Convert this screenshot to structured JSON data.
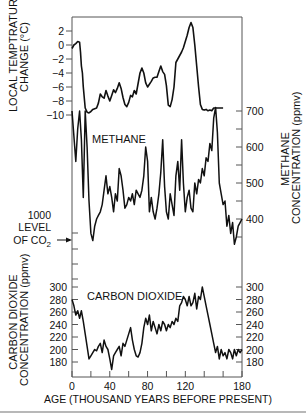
{
  "chart_data": {
    "type": "line",
    "title": "",
    "xlabel": "AGE (THOUSAND YEARS BEFORE PRESENT)",
    "x_ticks": [
      0,
      40,
      80,
      120,
      180
    ],
    "x_minor_ticks": [
      20,
      60,
      100,
      140,
      160
    ],
    "xlim": [
      0,
      180
    ],
    "panels": [
      {
        "name": "temperature",
        "ylabel_lines": [
          "LOCAL TEMPTRATURE",
          "CHANGE (°C)"
        ],
        "axis_side": "left",
        "y_ticks": [
          2,
          0,
          -2,
          -4,
          -6,
          -8,
          -10
        ],
        "ylim": [
          -10,
          3
        ],
        "series": [
          {
            "name": "Local temperature change",
            "x": [
              0,
              2,
              4,
              6,
              8,
              9,
              10,
              11,
              12,
              14,
              16,
              18,
              20,
              22,
              24,
              26,
              28,
              30,
              32,
              34,
              36,
              38,
              40,
              42,
              44,
              46,
              48,
              50,
              52,
              54,
              56,
              58,
              60,
              62,
              64,
              66,
              68,
              70,
              72,
              74,
              76,
              78,
              80,
              82,
              84,
              86,
              88,
              90,
              92,
              94,
              96,
              98,
              100,
              102,
              104,
              106,
              108,
              110,
              112,
              114,
              116,
              118,
              120,
              122,
              124,
              126,
              128,
              130,
              132,
              134,
              136,
              138,
              140,
              142,
              144,
              146,
              148,
              150,
              152,
              154,
              156,
              158,
              160
            ],
            "values": [
              -0.5,
              0,
              0.2,
              0.5,
              0.4,
              -1,
              -3,
              -4,
              -6,
              -9,
              -9.6,
              -9.7,
              -9.5,
              -9.2,
              -9.1,
              -9,
              -8.3,
              -7,
              -7.4,
              -7.6,
              -6.5,
              -7.3,
              -8,
              -7.2,
              -6.4,
              -6.8,
              -6.2,
              -5.4,
              -6.2,
              -7.5,
              -8.5,
              -8.8,
              -8.2,
              -7.2,
              -7.4,
              -6.5,
              -7,
              -5.5,
              -4,
              -3.3,
              -4,
              -5.4,
              -6,
              -5.6,
              -5.2,
              -4.7,
              -4.6,
              -4.6,
              -3.8,
              -3,
              -3.8,
              -4.2,
              -5.8,
              -8.6,
              -8.8,
              -7.8,
              -6,
              -2.5,
              -2,
              -1.5,
              -1,
              -0.4,
              0.5,
              1.4,
              2.5,
              3.2,
              2.5,
              0,
              -3,
              -6,
              -8.5,
              -9.2,
              -9.3,
              -9.2,
              -9.4,
              -9.3,
              -9.4,
              -9,
              -9,
              -9,
              -9,
              -9,
              -9
            ],
            "color": "#111111"
          }
        ]
      },
      {
        "name": "methane",
        "label": "METHANE",
        "ylabel_lines": [
          "METHANE",
          "CONCENTRATION (ppmv)"
        ],
        "axis_side": "right",
        "y_ticks": [
          400,
          500,
          600,
          700
        ],
        "y_minor_ticks": [
          350,
          450,
          550,
          650
        ],
        "ylim": [
          320,
          720
        ],
        "series": [
          {
            "name": "Methane concentration",
            "x": [
              0,
              4,
              6,
              8,
              10,
              12,
              14,
              16,
              18,
              20,
              22,
              24,
              26,
              28,
              30,
              32,
              34,
              36,
              38,
              40,
              42,
              44,
              46,
              48,
              50,
              52,
              54,
              56,
              58,
              60,
              62,
              64,
              66,
              68,
              70,
              72,
              74,
              76,
              78,
              80,
              82,
              84,
              86,
              88,
              90,
              92,
              94,
              96,
              98,
              100,
              102,
              104,
              106,
              108,
              110,
              112,
              114,
              116,
              118,
              120,
              122,
              124,
              126,
              128,
              130,
              132,
              134,
              136,
              138,
              140,
              142,
              144,
              146,
              148,
              150,
              152,
              154,
              156,
              158,
              160,
              162,
              164,
              166,
              168,
              170,
              172,
              174,
              176,
              178,
              180
            ],
            "values": [
              700,
              560,
              650,
              700,
              620,
              460,
              700,
              600,
              450,
              360,
              340,
              380,
              400,
              410,
              420,
              440,
              480,
              520,
              470,
              490,
              460,
              420,
              470,
              450,
              540,
              520,
              480,
              430,
              440,
              460,
              450,
              470,
              440,
              480,
              470,
              460,
              480,
              520,
              600,
              560,
              420,
              460,
              420,
              400,
              430,
              470,
              530,
              620,
              490,
              420,
              400,
              470,
              440,
              410,
              520,
              560,
              480,
              620,
              500,
              420,
              460,
              480,
              430,
              420,
              500,
              470,
              510,
              500,
              540,
              520,
              570,
              560,
              610,
              590,
              680,
              710,
              640,
              500,
              470,
              440,
              450,
              380,
              410,
              360,
              390,
              330,
              350,
              380,
              390,
              400
            ],
            "color": "#111111"
          }
        ]
      },
      {
        "name": "carbon_dioxide",
        "label": "CARBON DIOXIDE",
        "ylabel_lines": [
          "CARBON DIOXIDE",
          "CONCENTRATION (ppmv)"
        ],
        "axis_side": "both",
        "y_ticks": [
          180,
          200,
          220,
          240,
          260,
          280,
          300
        ],
        "ylim": [
          160,
          310
        ],
        "series": [
          {
            "name": "Carbon dioxide concentration",
            "x": [
              0,
              2,
              4,
              6,
              8,
              10,
              12,
              14,
              16,
              18,
              20,
              22,
              24,
              26,
              28,
              30,
              32,
              34,
              36,
              38,
              40,
              42,
              44,
              46,
              48,
              50,
              52,
              54,
              56,
              58,
              60,
              62,
              64,
              66,
              68,
              70,
              72,
              74,
              76,
              78,
              80,
              82,
              84,
              86,
              88,
              90,
              92,
              94,
              96,
              98,
              100,
              102,
              104,
              106,
              108,
              110,
              112,
              114,
              116,
              118,
              120,
              122,
              124,
              126,
              128,
              130,
              132,
              134,
              136,
              138,
              140,
              142,
              144,
              146,
              148,
              150,
              152,
              154,
              156,
              158,
              160,
              162,
              164,
              166,
              168,
              170,
              172,
              174,
              176,
              178,
              180
            ],
            "values": [
              280,
              270,
              255,
              262,
              250,
              262,
              245,
              225,
              205,
              185,
              190,
              195,
              200,
              198,
              205,
              210,
              195,
              215,
              205,
              200,
              185,
              168,
              190,
              195,
              200,
              205,
              190,
              210,
              205,
              215,
              225,
              235,
              215,
              200,
              190,
              188,
              195,
              210,
              235,
              250,
              240,
              255,
              230,
              245,
              235,
              225,
              240,
              230,
              245,
              240,
              230,
              240,
              235,
              245,
              240,
              250,
              245,
              270,
              275,
              285,
              280,
              270,
              285,
              270,
              275,
              290,
              265,
              285,
              280,
              300,
              285,
              270,
              255,
              240,
              225,
              210,
              195,
              205,
              185,
              200,
              190,
              195,
              185,
              200,
              195,
              185,
              200,
              190,
              200,
              195,
              200
            ],
            "color": "#111111"
          }
        ]
      }
    ],
    "annotations": [
      {
        "text_lines": [
          "1000",
          "LEVEL",
          "OF CO₂"
        ],
        "arrow": "right",
        "points_to": "left axis between methane and CO2 panels"
      }
    ],
    "grid": false,
    "legend": null
  },
  "labels": {
    "temp_ylabel_1": "LOCAL TEMPTRATURE",
    "temp_ylabel_2": "CHANGE (°C)",
    "methane_ylabel_1": "METHANE",
    "methane_ylabel_2": "CONCENTRATION (ppmv)",
    "co2_ylabel_1": "CARBON DIOXIDE",
    "co2_ylabel_2": "CONCENTRATION (ppmv)",
    "co2_level_1": "1000",
    "co2_level_2": "LEVEL",
    "co2_level_3": "OF CO",
    "co2_level_sub": "2",
    "xlabel": "AGE (THOUSAND YEARS BEFORE PRESENT)",
    "methane_panel": "METHANE",
    "co2_panel": "CARBON DIOXIDE"
  }
}
